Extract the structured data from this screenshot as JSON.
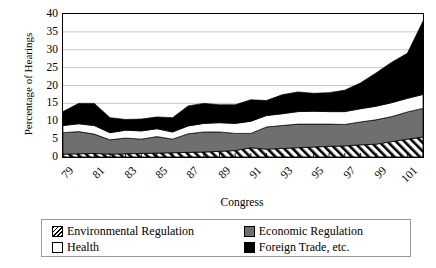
{
  "chart_data": {
    "type": "area",
    "stacked": true,
    "title": "",
    "xlabel": "Congress",
    "ylabel": "Percentage of Hearings",
    "ylim": [
      0,
      40
    ],
    "ytick_step": 5,
    "yticks": [
      40,
      35,
      30,
      25,
      20,
      15,
      10,
      5,
      0
    ],
    "grid": "horizontal",
    "legend_position": "bottom",
    "x": [
      79,
      80,
      81,
      82,
      83,
      84,
      85,
      86,
      87,
      88,
      89,
      90,
      91,
      92,
      93,
      94,
      95,
      96,
      97,
      98,
      99,
      100,
      101,
      102
    ],
    "xtick_labels": [
      "79",
      "81",
      "83",
      "85",
      "87",
      "89",
      "91",
      "93",
      "95",
      "97",
      "99",
      "101"
    ],
    "series": [
      {
        "name": "Environmental Regulation",
        "fill": "hatch",
        "color": "#ffffff",
        "values": [
          0.8,
          0.9,
          1.0,
          0.8,
          0.9,
          1.0,
          1.1,
          1.2,
          1.3,
          1.4,
          1.6,
          1.8,
          2.6,
          2.2,
          2.4,
          2.6,
          2.8,
          3.0,
          3.1,
          3.4,
          3.6,
          4.3,
          5.0,
          5.6
        ]
      },
      {
        "name": "Economic Regulation",
        "fill": "solid",
        "color": "#6f6f6f",
        "values": [
          6.0,
          6.2,
          5.4,
          4.0,
          4.4,
          4.0,
          4.6,
          3.8,
          5.2,
          5.6,
          5.4,
          4.8,
          4.0,
          6.2,
          6.4,
          6.6,
          6.4,
          6.2,
          6.0,
          6.4,
          6.8,
          7.0,
          7.6,
          8.0
        ]
      },
      {
        "name": "Health",
        "fill": "solid",
        "color": "#ffffff",
        "values": [
          2.0,
          2.2,
          2.4,
          2.0,
          2.2,
          2.3,
          2.2,
          2.0,
          2.2,
          2.4,
          2.6,
          2.8,
          3.4,
          3.2,
          3.3,
          3.5,
          3.6,
          3.5,
          3.6,
          3.7,
          3.8,
          3.9,
          3.8,
          3.9
        ]
      },
      {
        "name": "Foreign Trade, etc.",
        "fill": "solid",
        "color": "#000000",
        "values": [
          3.9,
          5.7,
          6.2,
          4.2,
          3.0,
          3.3,
          3.3,
          4.0,
          5.6,
          5.6,
          5.0,
          5.2,
          6.0,
          4.2,
          5.3,
          5.5,
          5.0,
          5.3,
          6.0,
          7.2,
          9.3,
          11.3,
          12.6,
          20.5
        ]
      }
    ],
    "totals": [
      12.7,
      15.0,
      15.0,
      11.0,
      10.5,
      10.6,
      11.2,
      11.0,
      14.3,
      15.0,
      14.6,
      14.6,
      16.0,
      15.8,
      17.4,
      18.2,
      17.8,
      18.0,
      18.7,
      20.7,
      23.5,
      26.5,
      29.0,
      38.0
    ]
  },
  "legend": {
    "entries": [
      {
        "label": "Environmental Regulation",
        "swatch": "hatch"
      },
      {
        "label": "Economic Regulation",
        "swatch": "gray"
      },
      {
        "label": "Health",
        "swatch": "white"
      },
      {
        "label": "Foreign Trade, etc.",
        "swatch": "black"
      }
    ]
  }
}
